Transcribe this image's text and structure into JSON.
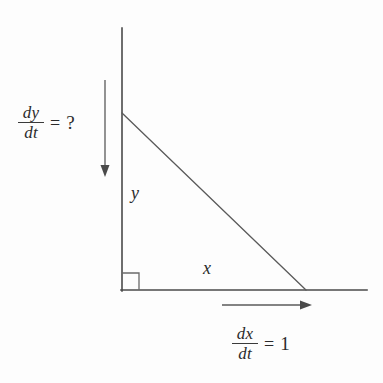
{
  "figure": {
    "background_color": "#fdfdfd",
    "line_color": "#4a4a4a",
    "text_color": "#2b2b2b"
  },
  "labels": {
    "dydt": {
      "numerator": "dy",
      "denominator": "dt",
      "equals": "=",
      "value": "?",
      "full": "dy/dt = ?"
    },
    "dxdt": {
      "numerator": "dx",
      "denominator": "dt",
      "equals": "=",
      "value": "1",
      "full": "dx/dt = 1"
    },
    "vertical_leg": "y",
    "horizontal_leg": "x"
  },
  "geometry": {
    "wall_line": {
      "x1": 122,
      "y1": 28,
      "x2": 122,
      "y2": 290
    },
    "ground_line": {
      "x1": 122,
      "y1": 290,
      "x2": 367,
      "y2": 290
    },
    "hypotenuse": {
      "x1": 122,
      "y1": 113,
      "x2": 305,
      "y2": 290
    },
    "right_angle_marker": {
      "x": 122,
      "y": 290,
      "size": 16
    },
    "down_arrow": {
      "x": 105,
      "y1": 80,
      "y2": 176
    },
    "right_arrow": {
      "y": 305,
      "x1": 222,
      "x2": 312
    }
  }
}
